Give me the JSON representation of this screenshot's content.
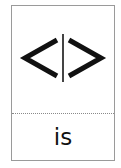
{
  "card": {
    "symbol": "<|>",
    "symbol_icon": "angle-brackets-with-bar",
    "word": "is"
  },
  "colors": {
    "border": "#9a9a9a",
    "glyph": "#111111",
    "bar": "#444444",
    "divider": "#8a8a8a"
  }
}
